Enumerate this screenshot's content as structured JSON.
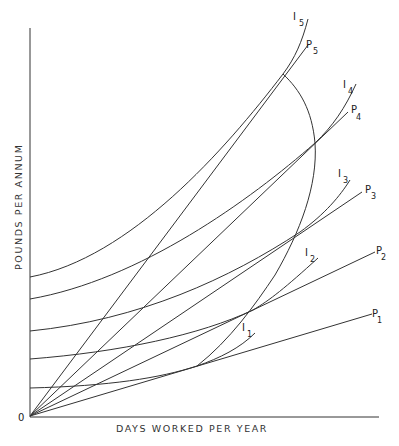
{
  "diagram": {
    "y_axis_label": "POUNDS PER ANNUM",
    "x_axis_label": "DAYS WORKED PER YEAR",
    "origin_label": "0",
    "indifference_curves": [
      {
        "id": "I1",
        "label": "I",
        "sub": "1"
      },
      {
        "id": "I2",
        "label": "I",
        "sub": "2"
      },
      {
        "id": "I3",
        "label": "I",
        "sub": "3"
      },
      {
        "id": "I4",
        "label": "I",
        "sub": "4"
      },
      {
        "id": "I5",
        "label": "I",
        "sub": "5"
      }
    ],
    "price_lines": [
      {
        "id": "P1",
        "label": "P",
        "sub": "1"
      },
      {
        "id": "P2",
        "label": "P",
        "sub": "2"
      },
      {
        "id": "P3",
        "label": "P",
        "sub": "3"
      },
      {
        "id": "P4",
        "label": "P",
        "sub": "4"
      },
      {
        "id": "P5",
        "label": "P",
        "sub": "5"
      }
    ],
    "supply_curve": "backward-bending locus of tangency points"
  }
}
